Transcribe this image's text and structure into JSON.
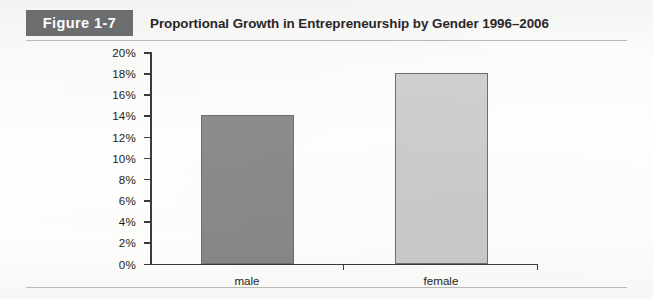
{
  "figure": {
    "tag": "Figure 1-7",
    "title": "Proportional Growth in Entrepreneurship by Gender 1996–2006"
  },
  "colors": {
    "tag_background": "#6d6e70",
    "tag_text": "#ffffff",
    "axis": "#3c3a3b",
    "bar_male": "#898a8a",
    "bar_female": "#cbcccc",
    "bar_border": "#6f6f70",
    "rule": "#b9b9b7",
    "page_background": "#ffffff"
  },
  "chart_data": {
    "type": "bar",
    "title": "Proportional Growth in Entrepreneurship by Gender 1996–2006",
    "categories": [
      "male",
      "female"
    ],
    "values": [
      14,
      18
    ],
    "series": [
      {
        "name": "Proportional Growth",
        "values": [
          14,
          18
        ]
      }
    ],
    "xlabel": "",
    "ylabel": "",
    "ylim": [
      0,
      20
    ],
    "ytick_step": 2,
    "ytick_labels": [
      "0%",
      "2%",
      "4%",
      "6%",
      "8%",
      "10%",
      "12%",
      "14%",
      "16%",
      "18%",
      "20%"
    ],
    "ytick_values": [
      0,
      2,
      4,
      6,
      8,
      10,
      12,
      14,
      16,
      18,
      20
    ],
    "value_suffix": "%",
    "grid": false,
    "legend": false,
    "bar_colors": [
      "#898a8a",
      "#cbcccc"
    ]
  }
}
